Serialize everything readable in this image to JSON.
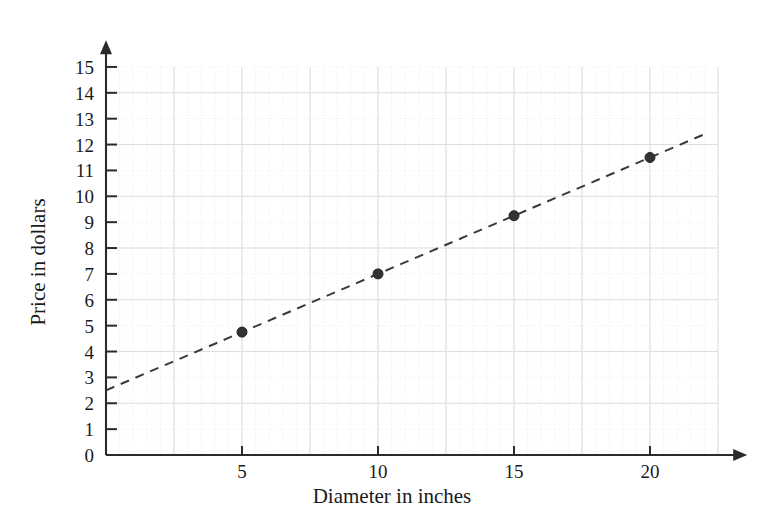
{
  "chart_data": {
    "type": "scatter",
    "title": "",
    "xlabel": "Diameter in inches",
    "ylabel": "Price in dollars",
    "xlim": [
      0,
      22.5
    ],
    "ylim": [
      0,
      15.6
    ],
    "x_ticks": [
      5,
      10,
      15,
      20
    ],
    "x_tick_labels": [
      "5",
      "10",
      "15",
      "20"
    ],
    "y_ticks": [
      0,
      1,
      2,
      3,
      4,
      5,
      6,
      7,
      8,
      9,
      10,
      11,
      12,
      13,
      14,
      15
    ],
    "y_tick_labels": [
      "0",
      "1",
      "2",
      "3",
      "4",
      "5",
      "6",
      "7",
      "8",
      "9",
      "10",
      "11",
      "12",
      "13",
      "14",
      "15"
    ],
    "grid": true,
    "grid_major_x_step": 2.5,
    "grid_major_y_step": 2,
    "grid_minor_x_step": 0.5,
    "grid_minor_y_step": 1,
    "legend": false,
    "legend_position": "none",
    "series": [
      {
        "name": "Price vs diameter",
        "style": "points",
        "marker": "filled-circle",
        "color": "#333333",
        "x": [
          5,
          10,
          15,
          20
        ],
        "y": [
          4.75,
          7.0,
          9.25,
          11.5
        ]
      },
      {
        "name": "Trend line",
        "style": "dashed-line",
        "color": "#3a3a3a",
        "x": [
          0,
          22
        ],
        "y": [
          2.5,
          12.4
        ],
        "slope": 0.45,
        "intercept": 2.5
      }
    ],
    "annotations": []
  },
  "axes": {
    "x_axis_name": "Diameter in inches",
    "y_axis_name": "Price in dollars",
    "x_arrow": true,
    "y_arrow": true
  },
  "colors": {
    "axis": "#2b2b2b",
    "grid_major": "#dedee3",
    "grid_minor": "#e9e9ec",
    "marker": "#333333",
    "trendline": "#3a3a3a",
    "background": "#ffffff"
  }
}
